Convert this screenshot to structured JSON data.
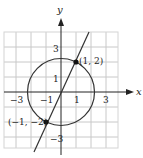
{
  "figure": {
    "x_axis_label": "x",
    "y_axis_label": "y",
    "x_tick_labels": [
      "−3",
      "−1",
      "1",
      "3"
    ],
    "y_tick_labels": [
      "3",
      "1",
      "−3"
    ],
    "points": [
      {
        "label": "(1, 2)",
        "x": 1,
        "y": 2
      },
      {
        "label": "(−1, −2)",
        "x": -1,
        "y": -2
      }
    ],
    "circle": {
      "center": [
        0,
        0
      ],
      "radius": 2.236
    },
    "line": {
      "slope": 2,
      "intercept": 0
    },
    "colors": {
      "grid": "#c8c8c8",
      "curve": "#333333",
      "axis": "#222222",
      "point": "#111111"
    }
  }
}
